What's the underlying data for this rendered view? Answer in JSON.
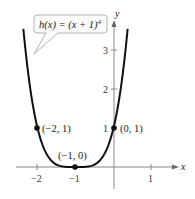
{
  "chart_data": {
    "type": "line",
    "title": "",
    "function_label": "h(x) = (x + 1)^4",
    "function_label_parts": {
      "lhs": "h(x) = (x + 1)",
      "exponent": "4"
    },
    "xlabel": "x",
    "ylabel": "y",
    "xlim": [
      -2.5,
      1.5
    ],
    "ylim": [
      -0.5,
      3.7
    ],
    "x_ticks": [
      -2,
      -1,
      1
    ],
    "x_tick_labels": [
      "−2",
      "−1",
      "1"
    ],
    "y_ticks": [
      1,
      2,
      3
    ],
    "y_tick_labels": [
      "1",
      "2",
      "3"
    ],
    "grid": false,
    "series": [
      {
        "name": "h(x) = (x + 1)^4",
        "color": "#111111",
        "x": [
          -2.37,
          -2.2,
          -2.0,
          -1.8,
          -1.6,
          -1.4,
          -1.2,
          -1.0,
          -0.8,
          -0.6,
          -0.4,
          -0.2,
          0.0,
          0.2,
          0.37
        ],
        "y": [
          3.52,
          2.07,
          1.0,
          0.41,
          0.13,
          0.026,
          0.0016,
          0.0,
          0.0016,
          0.026,
          0.13,
          0.41,
          1.0,
          2.07,
          3.52
        ]
      }
    ],
    "labeled_points": [
      {
        "x": -2,
        "y": 1,
        "label": "(−2, 1)"
      },
      {
        "x": -1,
        "y": 0,
        "label": "(−1, 0)"
      },
      {
        "x": 0,
        "y": 1,
        "label": "(0, 1)"
      }
    ]
  },
  "labels": {
    "function_lhs": "h(x) = (x + 1)",
    "function_exp": "4",
    "x_axis": "x",
    "y_axis": "y",
    "xt0": "−2",
    "xt1": "−1",
    "xt2": "1",
    "yt0": "1",
    "yt1": "2",
    "yt2": "3",
    "p0": "(−2, 1)",
    "p1": "(−1, 0)",
    "p2": "(0, 1)"
  }
}
